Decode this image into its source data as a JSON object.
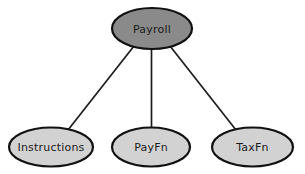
{
  "diagram": {
    "type": "node-link-graph",
    "background_color": "#ffffff",
    "root": {
      "id": "payroll",
      "label": "Payroll",
      "fill_color": "#8a8a8a",
      "stroke_color": "#111111",
      "cx": 152,
      "cy": 28.5,
      "rx": 40,
      "ry": 20.5
    },
    "children": [
      {
        "id": "instructions",
        "label": "Instructions",
        "fill_color": "#d2d2d2",
        "stroke_color": "#111111",
        "cx": 51,
        "cy": 147,
        "rx": 42,
        "ry": 19.5
      },
      {
        "id": "payfn",
        "label": "PayFn",
        "fill_color": "#d2d2d2",
        "stroke_color": "#111111",
        "cx": 151,
        "cy": 147,
        "rx": 39,
        "ry": 19.5
      },
      {
        "id": "taxfn",
        "label": "TaxFn",
        "fill_color": "#d2d2d2",
        "stroke_color": "#111111",
        "cx": 252.5,
        "cy": 147,
        "rx": 40.5,
        "ry": 19.5
      }
    ],
    "edges": [
      {
        "id": "edge-payroll-instructions",
        "from": "payroll",
        "to": "instructions",
        "color": "#1c1c1c",
        "x1": 134,
        "y1": 46,
        "x2": 68,
        "y2": 130
      },
      {
        "id": "edge-payroll-payfn",
        "from": "payroll",
        "to": "payfn",
        "color": "#1c1c1c",
        "x1": 151.5,
        "y1": 49,
        "x2": 151.5,
        "y2": 128
      },
      {
        "id": "edge-payroll-taxfn",
        "from": "payroll",
        "to": "taxfn",
        "color": "#1c1c1c",
        "x1": 170,
        "y1": 46,
        "x2": 236,
        "y2": 130
      }
    ]
  }
}
